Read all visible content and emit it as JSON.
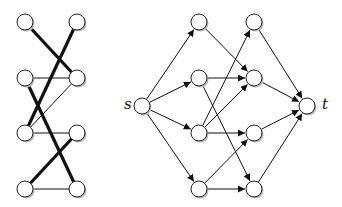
{
  "colors": {
    "edge": "#111111",
    "node_fill": "#ffffff",
    "node_stroke": "#222222",
    "shadow": "#b8b8b8"
  },
  "left_graph": {
    "name": "bipartite-matching",
    "node_radius": 8,
    "nodes": [
      {
        "id": "L0",
        "x": 25,
        "y": 22
      },
      {
        "id": "L1",
        "x": 25,
        "y": 78
      },
      {
        "id": "L2",
        "x": 25,
        "y": 133
      },
      {
        "id": "L3",
        "x": 25,
        "y": 189
      },
      {
        "id": "R0",
        "x": 77,
        "y": 22
      },
      {
        "id": "R1",
        "x": 77,
        "y": 78
      },
      {
        "id": "R2",
        "x": 77,
        "y": 133
      },
      {
        "id": "R3",
        "x": 77,
        "y": 189
      }
    ],
    "edges": [
      {
        "from": "L1",
        "to": "R1",
        "thick": false
      },
      {
        "from": "L2",
        "to": "R1",
        "thick": false
      },
      {
        "from": "L2",
        "to": "R2",
        "thick": false
      },
      {
        "from": "L3",
        "to": "R3",
        "thick": false
      },
      {
        "from": "L0",
        "to": "R1",
        "thick": true
      },
      {
        "from": "R0",
        "to": "L2",
        "thick": true
      },
      {
        "from": "L1",
        "to": "R3",
        "thick": true
      },
      {
        "from": "L3",
        "to": "R2",
        "thick": true
      }
    ]
  },
  "right_graph": {
    "name": "flow-network",
    "node_radius": 8,
    "labels": {
      "source": "s",
      "sink": "t"
    },
    "nodes": [
      {
        "id": "s",
        "x": 142,
        "y": 106
      },
      {
        "id": "A0",
        "x": 199,
        "y": 22
      },
      {
        "id": "A1",
        "x": 199,
        "y": 78
      },
      {
        "id": "A2",
        "x": 199,
        "y": 133
      },
      {
        "id": "A3",
        "x": 199,
        "y": 189
      },
      {
        "id": "B0",
        "x": 254,
        "y": 22
      },
      {
        "id": "B1",
        "x": 254,
        "y": 78
      },
      {
        "id": "B2",
        "x": 254,
        "y": 133
      },
      {
        "id": "B3",
        "x": 254,
        "y": 189
      },
      {
        "id": "t",
        "x": 307,
        "y": 106
      }
    ],
    "edges": [
      {
        "from": "s",
        "to": "A0"
      },
      {
        "from": "s",
        "to": "A1"
      },
      {
        "from": "s",
        "to": "A2"
      },
      {
        "from": "s",
        "to": "A3"
      },
      {
        "from": "A0",
        "to": "B1"
      },
      {
        "from": "A1",
        "to": "B1"
      },
      {
        "from": "A1",
        "to": "B3"
      },
      {
        "from": "A2",
        "to": "B0"
      },
      {
        "from": "A2",
        "to": "B1"
      },
      {
        "from": "A2",
        "to": "B2"
      },
      {
        "from": "A3",
        "to": "B2"
      },
      {
        "from": "A3",
        "to": "B3"
      },
      {
        "from": "B0",
        "to": "t"
      },
      {
        "from": "B1",
        "to": "t"
      },
      {
        "from": "B2",
        "to": "t"
      },
      {
        "from": "B3",
        "to": "t"
      }
    ]
  }
}
